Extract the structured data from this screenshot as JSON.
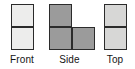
{
  "figure": {
    "background_color": "#ffffff",
    "outline_color": "#2b2b2b",
    "label_color": "#141414"
  },
  "views": [
    {
      "key": "front",
      "label": "Front",
      "fill_color": "#ededec",
      "grid_columns": 1,
      "grid_rows": 2,
      "cell_count": 2,
      "cells": [
        {
          "col": 0,
          "row": 0
        },
        {
          "col": 0,
          "row": 1
        }
      ]
    },
    {
      "key": "side",
      "label": "Side",
      "fill_color": "#9b9b9b",
      "grid_columns": 2,
      "grid_rows": 2,
      "cell_count": 3,
      "cells": [
        {
          "col": 0,
          "row": 0
        },
        {
          "col": 0,
          "row": 1
        },
        {
          "col": 1,
          "row": 1
        }
      ]
    },
    {
      "key": "top",
      "label": "Top",
      "fill_color": "#d7d7d6",
      "grid_columns": 1,
      "grid_rows": 2,
      "cell_count": 2,
      "cells": [
        {
          "col": 0,
          "row": 0
        },
        {
          "col": 0,
          "row": 1
        }
      ]
    }
  ]
}
